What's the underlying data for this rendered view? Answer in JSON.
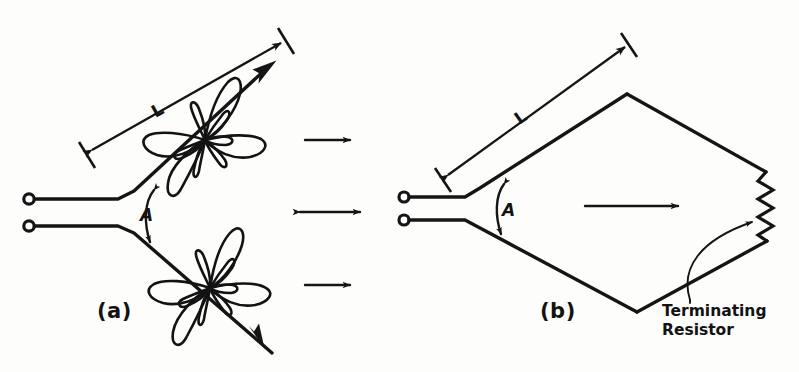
{
  "figure": {
    "type": "technical-line-diagram",
    "background_color": "#fdfdfb",
    "ink_color": "#151515"
  },
  "panels": [
    {
      "id": "a",
      "caption": "(a)",
      "description": "Two diverging antenna wires with radiation lobe patterns",
      "labels": {
        "length": "L",
        "angle": "A"
      }
    },
    {
      "id": "b",
      "caption": "(b)",
      "description": "Closed rhombic antenna terminated by a resistor",
      "labels": {
        "length": "L",
        "angle": "A"
      }
    }
  ],
  "annotations": {
    "terminating_resistor_line1": "Terminating",
    "terminating_resistor_line2": "Resistor",
    "caption_a": "(a)",
    "caption_b": "(b)",
    "length_label_a": "L",
    "length_label_b": "L",
    "angle_label_a": "A",
    "angle_label_b": "A"
  },
  "icons": {
    "direction_arrow_upper": "arrow-right-icon",
    "direction_arrow_middle": "arrow-left-right-icon",
    "direction_arrow_lower": "arrow-right-icon",
    "direction_arrow_b": "arrow-right-icon",
    "resistor": "zigzag-resistor-icon",
    "terminal_upper": "terminal-circle-icon",
    "terminal_lower": "terminal-circle-icon"
  }
}
